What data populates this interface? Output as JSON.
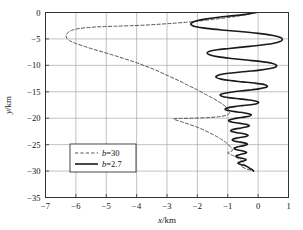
{
  "chart_data": {
    "type": "line",
    "title": "",
    "xlabel": "x/km",
    "ylabel": "y/km",
    "xlim": [
      -7,
      1
    ],
    "ylim": [
      -35,
      0
    ],
    "xticks": [
      -7,
      -6,
      -5,
      -4,
      -3,
      -2,
      -1,
      0,
      1
    ],
    "xticklabels": [
      "−7",
      "−6",
      "−5",
      "−4",
      "−3",
      "−2",
      "−1",
      "0",
      "1"
    ],
    "yticks": [
      0,
      -5,
      -10,
      -15,
      -20,
      -25,
      -30,
      -35
    ],
    "yticklabels": [
      "0",
      "−5",
      "−10",
      "−15",
      "−20",
      "−25",
      "−30",
      "−35"
    ],
    "grid": true,
    "grid_color": "#999999",
    "frame_color": "#333333",
    "background": "#ffffff",
    "legend_position": "lower-left",
    "series": [
      {
        "name": "b=30",
        "label_prefix": "b",
        "label_value": "=30",
        "style": "dashed",
        "color": "#555555",
        "width": 1.0,
        "points": [
          [
            -0.05,
            0.0
          ],
          [
            -0.35,
            -0.35
          ],
          [
            -0.75,
            -0.75
          ],
          [
            -1.2,
            -1.1
          ],
          [
            -1.7,
            -1.45
          ],
          [
            -2.2,
            -1.75
          ],
          [
            -2.7,
            -2.0
          ],
          [
            -3.2,
            -2.2
          ],
          [
            -3.7,
            -2.38
          ],
          [
            -4.2,
            -2.5
          ],
          [
            -4.7,
            -2.6
          ],
          [
            -5.15,
            -2.68
          ],
          [
            -5.5,
            -2.8
          ],
          [
            -5.85,
            -3.0
          ],
          [
            -6.1,
            -3.3
          ],
          [
            -6.25,
            -3.75
          ],
          [
            -6.32,
            -4.3
          ],
          [
            -6.3,
            -4.85
          ],
          [
            -6.2,
            -5.35
          ],
          [
            -6.0,
            -5.85
          ],
          [
            -5.75,
            -6.35
          ],
          [
            -5.45,
            -6.9
          ],
          [
            -5.1,
            -7.5
          ],
          [
            -4.75,
            -8.1
          ],
          [
            -4.4,
            -8.75
          ],
          [
            -4.05,
            -9.4
          ],
          [
            -3.75,
            -10.05
          ],
          [
            -3.45,
            -10.7
          ],
          [
            -3.2,
            -11.35
          ],
          [
            -2.95,
            -12.0
          ],
          [
            -2.72,
            -12.6
          ],
          [
            -2.5,
            -13.2
          ],
          [
            -2.3,
            -13.8
          ],
          [
            -2.1,
            -14.35
          ],
          [
            -1.92,
            -14.9
          ],
          [
            -1.74,
            -15.45
          ],
          [
            -1.58,
            -15.95
          ],
          [
            -1.42,
            -16.45
          ],
          [
            -1.28,
            -16.95
          ],
          [
            -1.16,
            -17.4
          ],
          [
            -1.06,
            -17.85
          ],
          [
            -0.98,
            -18.3
          ],
          [
            -0.94,
            -18.7
          ],
          [
            -0.95,
            -19.1
          ],
          [
            -1.05,
            -19.45
          ],
          [
            -1.3,
            -19.72
          ],
          [
            -1.7,
            -19.9
          ],
          [
            -2.15,
            -20.0
          ],
          [
            -2.55,
            -20.05
          ],
          [
            -2.78,
            -20.1
          ],
          [
            -2.7,
            -20.35
          ],
          [
            -2.5,
            -20.7
          ],
          [
            -2.3,
            -21.1
          ],
          [
            -2.1,
            -21.5
          ],
          [
            -1.92,
            -21.9
          ],
          [
            -1.76,
            -22.3
          ],
          [
            -1.62,
            -22.7
          ],
          [
            -1.48,
            -23.1
          ],
          [
            -1.35,
            -23.5
          ],
          [
            -1.24,
            -23.9
          ],
          [
            -1.13,
            -24.3
          ],
          [
            -1.04,
            -24.7
          ],
          [
            -0.96,
            -25.1
          ],
          [
            -0.9,
            -25.5
          ],
          [
            -0.86,
            -25.85
          ],
          [
            -0.85,
            -26.15
          ],
          [
            -0.92,
            -26.35
          ],
          [
            -1.0,
            -26.5
          ],
          [
            -0.95,
            -26.75
          ],
          [
            -0.85,
            -27.0
          ],
          [
            -0.75,
            -27.3
          ],
          [
            -0.66,
            -27.6
          ],
          [
            -0.58,
            -27.9
          ],
          [
            -0.52,
            -28.2
          ],
          [
            -0.48,
            -28.5
          ],
          [
            -0.46,
            -28.75
          ],
          [
            -0.5,
            -28.95
          ],
          [
            -0.56,
            -29.1
          ],
          [
            -0.5,
            -29.3
          ],
          [
            -0.4,
            -29.55
          ],
          [
            -0.3,
            -29.75
          ],
          [
            -0.2,
            -29.9
          ],
          [
            -0.15,
            -30.0
          ]
        ]
      },
      {
        "name": "b=2.7",
        "label_prefix": "b",
        "label_value": "=2.7",
        "style": "solid",
        "color": "#1a1a1a",
        "width": 1.6,
        "points": [
          [
            -0.05,
            0.0
          ],
          [
            -0.35,
            -0.3
          ],
          [
            -0.8,
            -0.6
          ],
          [
            -1.3,
            -0.9
          ],
          [
            -1.75,
            -1.25
          ],
          [
            -2.05,
            -1.6
          ],
          [
            -2.2,
            -2.0
          ],
          [
            -2.2,
            -2.35
          ],
          [
            -2.05,
            -2.7
          ],
          [
            -1.7,
            -3.0
          ],
          [
            -1.2,
            -3.3
          ],
          [
            -0.6,
            -3.6
          ],
          [
            0.0,
            -3.95
          ],
          [
            0.45,
            -4.3
          ],
          [
            0.72,
            -4.7
          ],
          [
            0.8,
            -5.1
          ],
          [
            0.72,
            -5.5
          ],
          [
            0.48,
            -5.85
          ],
          [
            0.05,
            -6.2
          ],
          [
            -0.45,
            -6.5
          ],
          [
            -0.95,
            -6.8
          ],
          [
            -1.35,
            -7.05
          ],
          [
            -1.6,
            -7.35
          ],
          [
            -1.68,
            -7.7
          ],
          [
            -1.58,
            -8.05
          ],
          [
            -1.3,
            -8.4
          ],
          [
            -0.88,
            -8.7
          ],
          [
            -0.38,
            -9.0
          ],
          [
            0.12,
            -9.3
          ],
          [
            0.45,
            -9.6
          ],
          [
            0.6,
            -9.95
          ],
          [
            0.58,
            -10.3
          ],
          [
            0.4,
            -10.6
          ],
          [
            0.05,
            -10.9
          ],
          [
            -0.38,
            -11.15
          ],
          [
            -0.8,
            -11.4
          ],
          [
            -1.15,
            -11.65
          ],
          [
            -1.35,
            -11.95
          ],
          [
            -1.38,
            -12.3
          ],
          [
            -1.22,
            -12.6
          ],
          [
            -0.92,
            -12.88
          ],
          [
            -0.52,
            -13.12
          ],
          [
            -0.12,
            -13.35
          ],
          [
            0.18,
            -13.6
          ],
          [
            0.3,
            -13.9
          ],
          [
            0.24,
            -14.2
          ],
          [
            0.02,
            -14.45
          ],
          [
            -0.3,
            -14.68
          ],
          [
            -0.65,
            -14.9
          ],
          [
            -0.95,
            -15.12
          ],
          [
            -1.18,
            -15.38
          ],
          [
            -1.25,
            -15.65
          ],
          [
            -1.15,
            -15.92
          ],
          [
            -0.92,
            -16.15
          ],
          [
            -0.6,
            -16.35
          ],
          [
            -0.3,
            -16.55
          ],
          [
            -0.06,
            -16.78
          ],
          [
            0.02,
            -17.02
          ],
          [
            -0.05,
            -17.25
          ],
          [
            -0.25,
            -17.45
          ],
          [
            -0.52,
            -17.62
          ],
          [
            -0.78,
            -17.8
          ],
          [
            -0.98,
            -18.0
          ],
          [
            -1.08,
            -18.22
          ],
          [
            -1.05,
            -18.45
          ],
          [
            -0.9,
            -18.65
          ],
          [
            -0.68,
            -18.82
          ],
          [
            -0.45,
            -19.0
          ],
          [
            -0.28,
            -19.2
          ],
          [
            -0.22,
            -19.42
          ],
          [
            -0.3,
            -19.62
          ],
          [
            -0.48,
            -19.8
          ],
          [
            -0.68,
            -19.98
          ],
          [
            -0.86,
            -20.18
          ],
          [
            -0.96,
            -20.38
          ],
          [
            -0.95,
            -20.58
          ],
          [
            -0.84,
            -20.76
          ],
          [
            -0.66,
            -20.92
          ],
          [
            -0.46,
            -21.1
          ],
          [
            -0.32,
            -21.3
          ],
          [
            -0.3,
            -21.5
          ],
          [
            -0.4,
            -21.68
          ],
          [
            -0.56,
            -21.85
          ],
          [
            -0.74,
            -22.02
          ],
          [
            -0.86,
            -22.2
          ],
          [
            -0.9,
            -22.4
          ],
          [
            -0.84,
            -22.58
          ],
          [
            -0.7,
            -22.74
          ],
          [
            -0.52,
            -22.9
          ],
          [
            -0.38,
            -23.08
          ],
          [
            -0.33,
            -23.26
          ],
          [
            -0.4,
            -23.44
          ],
          [
            -0.55,
            -23.6
          ],
          [
            -0.7,
            -23.76
          ],
          [
            -0.82,
            -23.94
          ],
          [
            -0.85,
            -24.12
          ],
          [
            -0.8,
            -24.3
          ],
          [
            -0.66,
            -24.46
          ],
          [
            -0.5,
            -24.62
          ],
          [
            -0.38,
            -24.8
          ],
          [
            -0.36,
            -24.98
          ],
          [
            -0.44,
            -25.14
          ],
          [
            -0.58,
            -25.3
          ],
          [
            -0.7,
            -25.46
          ],
          [
            -0.78,
            -25.62
          ],
          [
            -0.78,
            -25.8
          ],
          [
            -0.7,
            -25.96
          ],
          [
            -0.56,
            -26.12
          ],
          [
            -0.44,
            -26.28
          ],
          [
            -0.38,
            -26.46
          ],
          [
            -0.42,
            -26.62
          ],
          [
            -0.54,
            -26.78
          ],
          [
            -0.65,
            -26.94
          ],
          [
            -0.72,
            -27.1
          ],
          [
            -0.72,
            -27.26
          ],
          [
            -0.64,
            -27.42
          ],
          [
            -0.52,
            -27.58
          ],
          [
            -0.42,
            -27.74
          ],
          [
            -0.4,
            -27.9
          ],
          [
            -0.46,
            -28.06
          ],
          [
            -0.56,
            -28.22
          ],
          [
            -0.64,
            -28.38
          ],
          [
            -0.66,
            -28.54
          ],
          [
            -0.6,
            -28.7
          ],
          [
            -0.5,
            -28.86
          ],
          [
            -0.4,
            -29.02
          ],
          [
            -0.34,
            -29.2
          ],
          [
            -0.3,
            -29.4
          ],
          [
            -0.24,
            -29.6
          ],
          [
            -0.18,
            -29.8
          ],
          [
            -0.15,
            -30.0
          ]
        ]
      }
    ]
  },
  "legend": {
    "entries": [
      {
        "label": "b=30",
        "style": "dashed"
      },
      {
        "label": "b=2.7",
        "style": "solid"
      }
    ]
  }
}
